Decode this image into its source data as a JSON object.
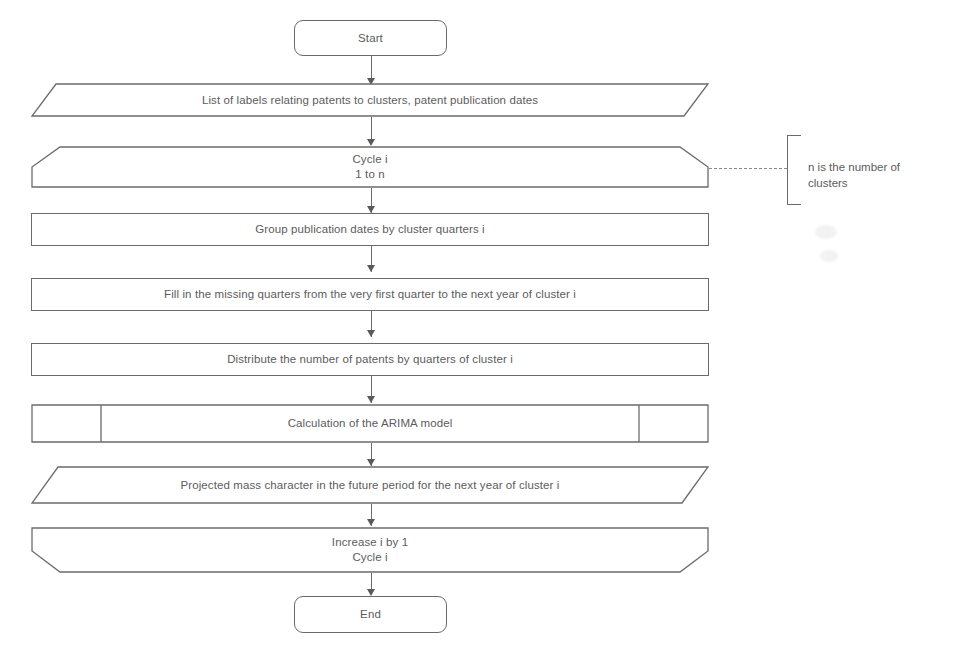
{
  "diagram": {
    "stroke_color": "#6b6b6b",
    "text_color": "#5c5c5c",
    "background_color": "#ffffff",
    "nodes": [
      {
        "id": "start",
        "shape": "terminator",
        "label": "Start"
      },
      {
        "id": "input",
        "shape": "data-parallelogram",
        "label": "List of labels relating patents to clusters, patent publication dates"
      },
      {
        "id": "loop-start",
        "shape": "loop-limit-start",
        "label": "Cycle i\n1 to n"
      },
      {
        "id": "group",
        "shape": "process",
        "label": "Group publication dates by cluster quarters i"
      },
      {
        "id": "fill",
        "shape": "process",
        "label": "Fill in the missing quarters from the very first quarter to the next year of cluster i"
      },
      {
        "id": "distribute",
        "shape": "process",
        "label": "Distribute the number of patents by quarters of cluster i"
      },
      {
        "id": "arima",
        "shape": "predefined-process",
        "label": "Calculation of the ARIMA model"
      },
      {
        "id": "output",
        "shape": "data-parallelogram",
        "label": "Projected mass character in the future period for the next year of cluster i"
      },
      {
        "id": "loop-end",
        "shape": "loop-limit-end",
        "label": "Increase i by 1\nCycle i"
      },
      {
        "id": "end",
        "shape": "terminator",
        "label": "End"
      }
    ],
    "annotations": [
      {
        "id": "n-note",
        "label": "n is the number of\nclusters",
        "attached_to": "loop-start"
      }
    ],
    "connectors": [
      {
        "from": "start",
        "to": "input",
        "type": "arrow"
      },
      {
        "from": "input",
        "to": "loop-start",
        "type": "arrow"
      },
      {
        "from": "loop-start",
        "to": "group",
        "type": "arrow"
      },
      {
        "from": "group",
        "to": "fill",
        "type": "arrow"
      },
      {
        "from": "fill",
        "to": "distribute",
        "type": "arrow"
      },
      {
        "from": "distribute",
        "to": "arima",
        "type": "arrow"
      },
      {
        "from": "arima",
        "to": "output",
        "type": "arrow"
      },
      {
        "from": "output",
        "to": "loop-end",
        "type": "arrow"
      },
      {
        "from": "loop-end",
        "to": "end",
        "type": "arrow"
      },
      {
        "from": "loop-start",
        "to": "n-note",
        "type": "dashed"
      }
    ]
  }
}
